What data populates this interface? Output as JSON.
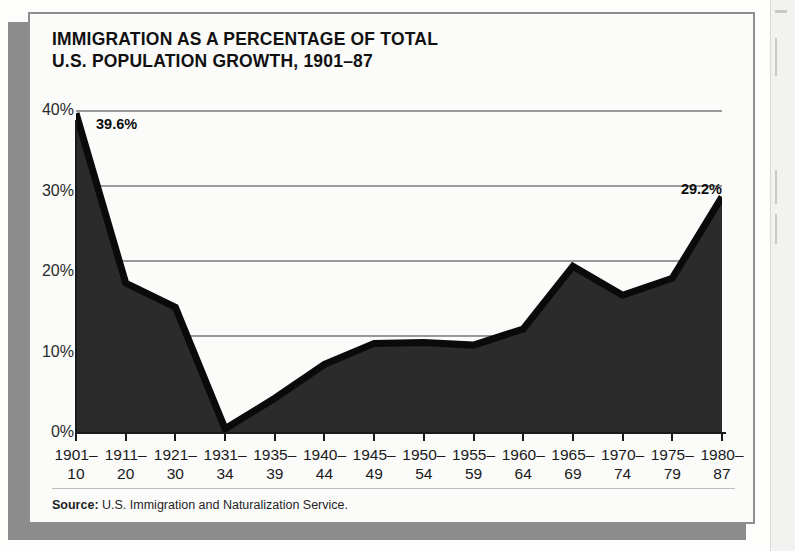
{
  "title": {
    "line1": "IMMIGRATION AS A PERCENTAGE OF TOTAL",
    "line2": "U.S. POPULATION GROWTH, 1901–87"
  },
  "source": {
    "label": "Source:",
    "text": " U.S. Immigration and Naturalization Service."
  },
  "callouts": {
    "first": "39.6%",
    "last": "29.2%"
  },
  "colors": {
    "area_fill": "#2b2b2b",
    "line": "#0a0a0a",
    "gridline": "#9a9a9a",
    "frame": "#8e8e8e",
    "shadow": "#8c8c8c",
    "paper": "#fbfbfa"
  },
  "chart_data": {
    "type": "area",
    "title": "IMMIGRATION AS A PERCENTAGE OF TOTAL U.S. POPULATION GROWTH, 1901–87",
    "xlabel": "",
    "ylabel": "",
    "ylim": [
      0,
      40
    ],
    "yticks": [
      0,
      10,
      20,
      30,
      40
    ],
    "ytick_labels": [
      "0%",
      "10%",
      "20%",
      "30%",
      "40%"
    ],
    "grid": true,
    "legend": "none",
    "categories": [
      "1901–\n10",
      "1911–\n20",
      "1921–\n30",
      "1931–\n34",
      "1935–\n39",
      "1940–\n44",
      "1945–\n49",
      "1950–\n54",
      "1955–\n59",
      "1960–\n64",
      "1965–\n69",
      "1970–\n74",
      "1975–\n79",
      "1980–\n87"
    ],
    "category_top": [
      "1901–",
      "1911–",
      "1921–",
      "1931–",
      "1935–",
      "1940–",
      "1945–",
      "1950–",
      "1955–",
      "1960–",
      "1965–",
      "1970–",
      "1975–",
      "1980–"
    ],
    "category_bottom": [
      "10",
      "20",
      "30",
      "34",
      "39",
      "44",
      "49",
      "54",
      "59",
      "64",
      "69",
      "74",
      "79",
      "87"
    ],
    "values": [
      39.6,
      18.5,
      15.5,
      0.4,
      4.2,
      8.4,
      11.0,
      11.1,
      10.8,
      12.8,
      20.6,
      17.0,
      19.1,
      29.2
    ],
    "annotations": [
      {
        "category": "1901–10",
        "value": 39.6,
        "text": "39.6%"
      },
      {
        "category": "1980–87",
        "value": 29.2,
        "text": "29.2%"
      }
    ]
  }
}
